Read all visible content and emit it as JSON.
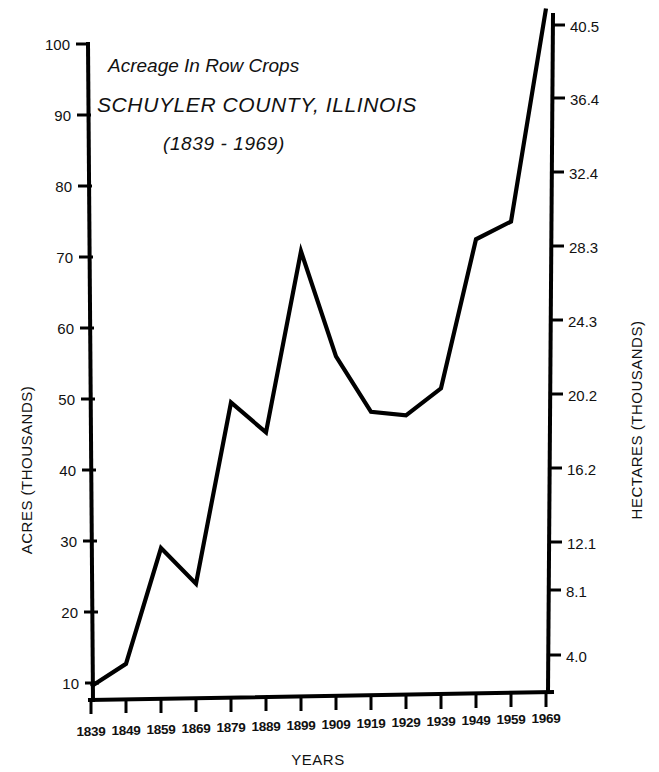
{
  "chart_data": {
    "type": "line",
    "title": "Acreage In Row Crops",
    "subtitle": "SCHUYLER COUNTY, ILLINOIS",
    "period": "(1839 - 1969)",
    "xlabel": "YEARS",
    "ylabel": "ACRES (THOUSANDS)",
    "ylabel_right": "HECTARES (THOUSANDS)",
    "grid": false,
    "legend": "none",
    "categories": [
      1839,
      1849,
      1859,
      1869,
      1879,
      1889,
      1899,
      1909,
      1919,
      1929,
      1939,
      1949,
      1959,
      1969
    ],
    "x_tick_labels": [
      "1839",
      "1849",
      "1859",
      "1869",
      "1879",
      "1889",
      "1899",
      "1909",
      "1919",
      "1929",
      "1939",
      "1949",
      "1959",
      "1969"
    ],
    "series": [
      {
        "name": "Acreage in row crops",
        "units": "thousands of acres",
        "values": [
          9.5,
          12.7,
          29.0,
          24.0,
          49.5,
          45.3,
          70.8,
          56.0,
          48.2,
          47.7,
          51.5,
          72.5,
          75.0,
          105.0
        ]
      }
    ],
    "ylim": [
      0,
      100
    ],
    "y_tick_labels": [
      "100",
      "90",
      "80",
      "70",
      "60",
      "50",
      "40",
      "30",
      "20",
      "10"
    ],
    "y_tick_values": [
      100,
      90,
      80,
      70,
      60,
      50,
      40,
      30,
      20,
      10
    ],
    "y_right_tick_labels": [
      "40.5",
      "36.4",
      "32.4",
      "28.3",
      "24.3",
      "20.2",
      "16.2",
      "12.1",
      "8.1",
      "4.0"
    ],
    "y_right_tick_values": [
      40.5,
      36.4,
      32.4,
      28.3,
      24.3,
      20.2,
      16.2,
      12.1,
      8.1,
      4.0
    ],
    "note_line_exits_top": "Line rises past the top of the plot area after 1959",
    "colors": {
      "line": "#000000",
      "axis": "#000000",
      "background": "#ffffff"
    }
  }
}
